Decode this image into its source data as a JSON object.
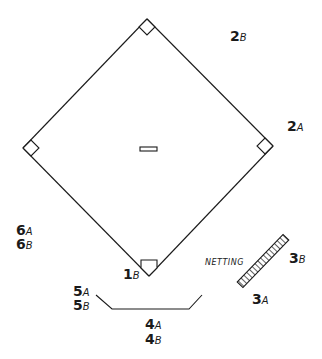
{
  "diagram": {
    "title": "",
    "colors": {
      "line": "#1a1a1a",
      "background": "#ffffff"
    },
    "field": {
      "second_base": [
        147,
        19
      ],
      "first_base": [
        273,
        146
      ],
      "third_base": [
        23,
        148
      ],
      "home_plate": [
        149,
        276
      ],
      "pitcher_rubber": {
        "x": 140,
        "y": 147,
        "w": 17,
        "h": 4
      }
    },
    "labels": [
      {
        "id": "2B",
        "num": "2",
        "sub": "B",
        "x": 230,
        "y": 28
      },
      {
        "id": "2A",
        "num": "2",
        "sub": "A",
        "x": 287,
        "y": 118
      },
      {
        "id": "6A",
        "num": "6",
        "sub": "A",
        "x": 16,
        "y": 222
      },
      {
        "id": "6B",
        "num": "6",
        "sub": "B",
        "x": 16,
        "y": 236
      },
      {
        "id": "1B",
        "num": "1",
        "sub": "B",
        "x": 123,
        "y": 266
      },
      {
        "id": "3B",
        "num": "3",
        "sub": "B",
        "x": 289,
        "y": 250
      },
      {
        "id": "3A",
        "num": "3",
        "sub": "A",
        "x": 252,
        "y": 291
      },
      {
        "id": "5A",
        "num": "5",
        "sub": "A",
        "x": 73,
        "y": 283
      },
      {
        "id": "5B",
        "num": "5",
        "sub": "B",
        "x": 73,
        "y": 297
      },
      {
        "id": "4A",
        "num": "4",
        "sub": "A",
        "x": 145,
        "y": 316
      },
      {
        "id": "4B",
        "num": "4",
        "sub": "B",
        "x": 145,
        "y": 331
      }
    ],
    "netting": {
      "label": "NETTING",
      "x": 205,
      "y": 258
    }
  }
}
